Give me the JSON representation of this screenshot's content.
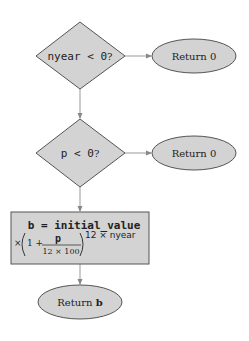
{
  "diagram": {
    "type": "flowchart",
    "colors": {
      "fill": "#d3d3d3",
      "stroke": "#555555",
      "edge": "#888888",
      "text": "#222222"
    },
    "nodes": [
      {
        "id": "cond1",
        "shape": "diamond",
        "code": "nyear < 0",
        "suffix": "?"
      },
      {
        "id": "ret1",
        "shape": "ellipse",
        "label": "Return 0"
      },
      {
        "id": "cond2",
        "shape": "diamond",
        "code": "p < 0",
        "suffix": "?"
      },
      {
        "id": "ret2",
        "shape": "ellipse",
        "label": "Return 0"
      },
      {
        "id": "calc",
        "shape": "rect",
        "line1": "b = initial_value",
        "times": "×",
        "one_plus": "1 +",
        "numerator": "p",
        "denominator": "12 × 100",
        "exponent": "12 × nyear"
      },
      {
        "id": "ret3",
        "shape": "ellipse",
        "label_prefix": "Return ",
        "label_bold": "b"
      }
    ],
    "edges": [
      {
        "from": "cond1",
        "to": "ret1"
      },
      {
        "from": "cond1",
        "to": "cond2"
      },
      {
        "from": "cond2",
        "to": "ret2"
      },
      {
        "from": "cond2",
        "to": "calc"
      },
      {
        "from": "calc",
        "to": "ret3"
      }
    ]
  }
}
